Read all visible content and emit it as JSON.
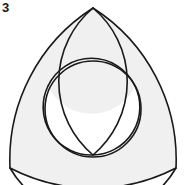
{
  "figure": {
    "label": "3",
    "title": "Reuleaux triangle with inscribed circle and trefoil arcs",
    "canvas": {
      "width": 185,
      "height": 185,
      "background": "#ffffff"
    },
    "colors": {
      "stroke": "#1a1a1a",
      "shade": "#f0f0f0",
      "shade_alt": "#f4f4f4",
      "background": "#ffffff",
      "label": "#1a1a1a"
    },
    "stroke_width": 1.6,
    "vertices": {
      "top": {
        "x": 93,
        "y": 8
      },
      "bottom_left": {
        "x": 10,
        "y": 168
      },
      "bottom_right": {
        "x": 176,
        "y": 168
      }
    },
    "inner_vertices": {
      "left": {
        "x": 48,
        "y": 86
      },
      "right": {
        "x": 135,
        "y": 86
      },
      "bottom": {
        "x": 93,
        "y": 155
      }
    },
    "reuleaux": {
      "side": 166,
      "arc_radius": 180,
      "description": "three circular arcs each centered at the opposite vertex"
    },
    "main_circle": {
      "center": {
        "x": 93,
        "y": 109
      },
      "radius": 48
    },
    "petal_arcs": {
      "radius": 48,
      "count": 3,
      "description": "three arcs of equal radius meeting at inner vertices forming a trefoil"
    },
    "shaded_regions": [
      "upper-left wing between reuleaux arc and main circle",
      "upper-right wing between reuleaux arc and main circle",
      "bottom wing between reuleaux arc and main circle",
      "upper lens between main circle and top petal arc",
      "lower-left petal",
      "lower-right petal"
    ]
  }
}
